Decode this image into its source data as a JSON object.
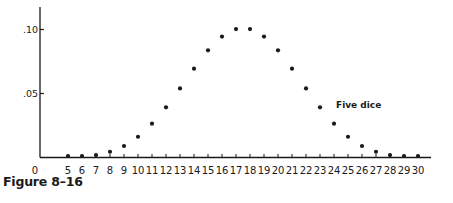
{
  "figure": {
    "caption": "Figure 8–16"
  },
  "chart_data": {
    "type": "scatter",
    "title": "",
    "caption": "Figure 8–16",
    "annotation": "Five dice",
    "xlabel": "",
    "ylabel": "",
    "x": [
      5,
      6,
      7,
      8,
      9,
      10,
      11,
      12,
      13,
      14,
      15,
      16,
      17,
      18,
      19,
      20,
      21,
      22,
      23,
      24,
      25,
      26,
      27,
      28,
      29,
      30
    ],
    "values": [
      0.0001,
      0.0006,
      0.0019,
      0.0045,
      0.009,
      0.0162,
      0.0264,
      0.0392,
      0.054,
      0.0694,
      0.0837,
      0.0945,
      0.1003,
      0.1003,
      0.0945,
      0.0837,
      0.0694,
      0.054,
      0.0392,
      0.0264,
      0.0162,
      0.009,
      0.0045,
      0.0019,
      0.0006,
      0.0001
    ],
    "series": [
      {
        "name": "Five dice",
        "x": [
          5,
          6,
          7,
          8,
          9,
          10,
          11,
          12,
          13,
          14,
          15,
          16,
          17,
          18,
          19,
          20,
          21,
          22,
          23,
          24,
          25,
          26,
          27,
          28,
          29,
          30
        ],
        "values": [
          0.0001,
          0.0006,
          0.0019,
          0.0045,
          0.009,
          0.0162,
          0.0264,
          0.0392,
          0.054,
          0.0694,
          0.0837,
          0.0945,
          0.1003,
          0.1003,
          0.0945,
          0.0837,
          0.0694,
          0.054,
          0.0392,
          0.0264,
          0.0162,
          0.009,
          0.0045,
          0.0019,
          0.0006,
          0.0001
        ]
      }
    ],
    "x_tick_labels": [
      "0",
      "5",
      "6",
      "7",
      "8",
      "9",
      "10",
      "11",
      "12",
      "13",
      "14",
      "15",
      "16",
      "17",
      "18",
      "19",
      "20",
      "21",
      "22",
      "23",
      "24",
      "25",
      "26",
      "27",
      "28",
      "29",
      "30"
    ],
    "y_ticks": [
      {
        "value": 0.1,
        "label": ".10"
      },
      {
        "value": 0.05,
        "label": ".05"
      }
    ],
    "ylim": [
      0,
      0.115
    ],
    "xlim": [
      0,
      31
    ],
    "grid": false,
    "legend": "none",
    "colors": {
      "ink": "#1a1a1a",
      "background": "#ffffff"
    }
  }
}
